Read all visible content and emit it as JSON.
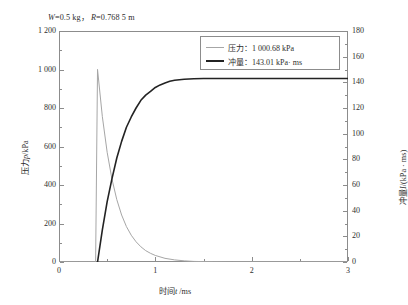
{
  "chart_data": {
    "type": "line",
    "title_parts": {
      "w_symbol": "W",
      "w_value": "=0.5 kg，",
      "r_symbol": "R",
      "r_value": "=0.768 5 m"
    },
    "xlabel": "时间t /ms",
    "xlabel_parts": {
      "pre": "时间",
      "sym": "t",
      "post": " /ms"
    },
    "ylabel_left": "压力p/kPa",
    "ylabel_left_parts": {
      "pre": "压力",
      "sym": "p",
      "post": "/kPa"
    },
    "ylabel_right": "冲量I/(kPa · ms)",
    "ylabel_right_parts": {
      "pre": "冲量",
      "sym": "I",
      "post": "/(kPa · ms)"
    },
    "xlim": [
      0,
      3
    ],
    "xticks": [
      0,
      1,
      2,
      3
    ],
    "xticklabels": [
      "0",
      "1",
      "2",
      "3"
    ],
    "xminorticks": [
      0.5,
      1.5,
      2.5
    ],
    "ylim_left": [
      0,
      1200
    ],
    "yticks_left": [
      0,
      200,
      400,
      600,
      800,
      1000,
      1200
    ],
    "yticklabels_left": [
      "0",
      "200",
      "400",
      "600",
      "800",
      "1 000",
      "1 200"
    ],
    "yminorticks_left": [
      100,
      300,
      500,
      700,
      900,
      1100
    ],
    "ylim_right": [
      0,
      180
    ],
    "yticks_right": [
      0,
      20,
      40,
      60,
      80,
      100,
      120,
      140,
      160,
      180
    ],
    "yticklabels_right": [
      "0",
      "20",
      "40",
      "60",
      "80",
      "100",
      "120",
      "140",
      "160",
      "180"
    ],
    "yminorticks_right": [
      10,
      30,
      50,
      70,
      90,
      110,
      130,
      150,
      170
    ],
    "grid": false,
    "legend_position": "upper-right",
    "series": [
      {
        "name": "压力",
        "legend_label": "压力：1 000.68 kPa",
        "peak_value": 1000.68,
        "unit": "kPa",
        "axis": "left",
        "color": "#a6a6a6",
        "linewidth": 1,
        "arrival_time": 0.4,
        "decay_time_constant": 0.17,
        "points": [
          [
            0.0,
            0
          ],
          [
            0.1,
            0
          ],
          [
            0.2,
            0
          ],
          [
            0.3,
            0
          ],
          [
            0.38,
            0
          ],
          [
            0.4,
            1000.68
          ],
          [
            0.45,
            755
          ],
          [
            0.5,
            570
          ],
          [
            0.55,
            430
          ],
          [
            0.6,
            324
          ],
          [
            0.65,
            244
          ],
          [
            0.7,
            184
          ],
          [
            0.75,
            139
          ],
          [
            0.8,
            105
          ],
          [
            0.85,
            79
          ],
          [
            0.9,
            59
          ],
          [
            0.95,
            45
          ],
          [
            1.0,
            34
          ],
          [
            1.1,
            19
          ],
          [
            1.2,
            11
          ],
          [
            1.3,
            6
          ],
          [
            1.4,
            3
          ],
          [
            1.6,
            1
          ],
          [
            1.8,
            0
          ],
          [
            2.0,
            0
          ],
          [
            2.5,
            0
          ],
          [
            3.0,
            0
          ]
        ]
      },
      {
        "name": "冲量",
        "legend_label": "冲量：143.01 kPa· ms",
        "plateau_value": 143.01,
        "unit": "kPa·ms",
        "axis": "right",
        "color": "#232323",
        "linewidth": 2,
        "arrival_time": 0.4,
        "points": [
          [
            0.0,
            -1.5
          ],
          [
            0.1,
            -1.5
          ],
          [
            0.2,
            -1.5
          ],
          [
            0.3,
            -1.5
          ],
          [
            0.38,
            -1.5
          ],
          [
            0.4,
            0
          ],
          [
            0.45,
            25
          ],
          [
            0.5,
            47
          ],
          [
            0.55,
            65
          ],
          [
            0.6,
            81
          ],
          [
            0.65,
            94
          ],
          [
            0.7,
            105
          ],
          [
            0.75,
            113
          ],
          [
            0.8,
            120
          ],
          [
            0.85,
            126
          ],
          [
            0.9,
            130
          ],
          [
            0.95,
            133
          ],
          [
            1.0,
            136
          ],
          [
            1.05,
            138
          ],
          [
            1.1,
            139.5
          ],
          [
            1.15,
            140.8
          ],
          [
            1.2,
            141.6
          ],
          [
            1.3,
            142.4
          ],
          [
            1.4,
            142.8
          ],
          [
            1.5,
            143.0
          ],
          [
            1.7,
            143.01
          ],
          [
            2.0,
            143.01
          ],
          [
            2.5,
            143.01
          ],
          [
            3.0,
            143.01
          ]
        ]
      }
    ]
  }
}
